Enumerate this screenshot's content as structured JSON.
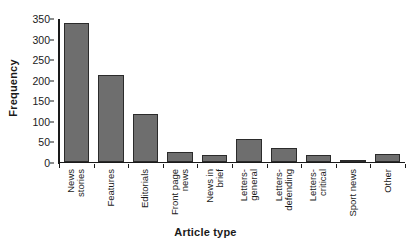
{
  "chart_data": {
    "type": "bar",
    "title": "",
    "xlabel": "Article type",
    "ylabel": "Frequency",
    "ylim": [
      0,
      350
    ],
    "ytick_step": 50,
    "yticks": [
      350,
      300,
      250,
      200,
      150,
      100,
      50,
      0
    ],
    "grid": false,
    "legend": null,
    "orientation": "vertical",
    "bar_color": "#6e6e6e",
    "bar_edge_color": "#2b2b2b",
    "background_color": "#ffffff",
    "categories": [
      "News stories",
      "Features",
      "Editorials",
      "Front page news",
      "News in brief",
      "Letters-general",
      "Letters-defending",
      "Letters-critical",
      "Sport news",
      "Other"
    ],
    "category_lines": [
      [
        "News",
        "stories"
      ],
      [
        "Features",
        ""
      ],
      [
        "Editorials",
        ""
      ],
      [
        "Front page",
        "news"
      ],
      [
        "News in",
        "brief"
      ],
      [
        "Letters-",
        "general"
      ],
      [
        "Letters-",
        "defending"
      ],
      [
        "Letters-",
        "critical"
      ],
      [
        "Sport news",
        ""
      ],
      [
        "Other",
        ""
      ]
    ],
    "values": [
      338,
      211,
      117,
      24,
      17,
      55,
      35,
      16,
      5,
      19
    ]
  }
}
